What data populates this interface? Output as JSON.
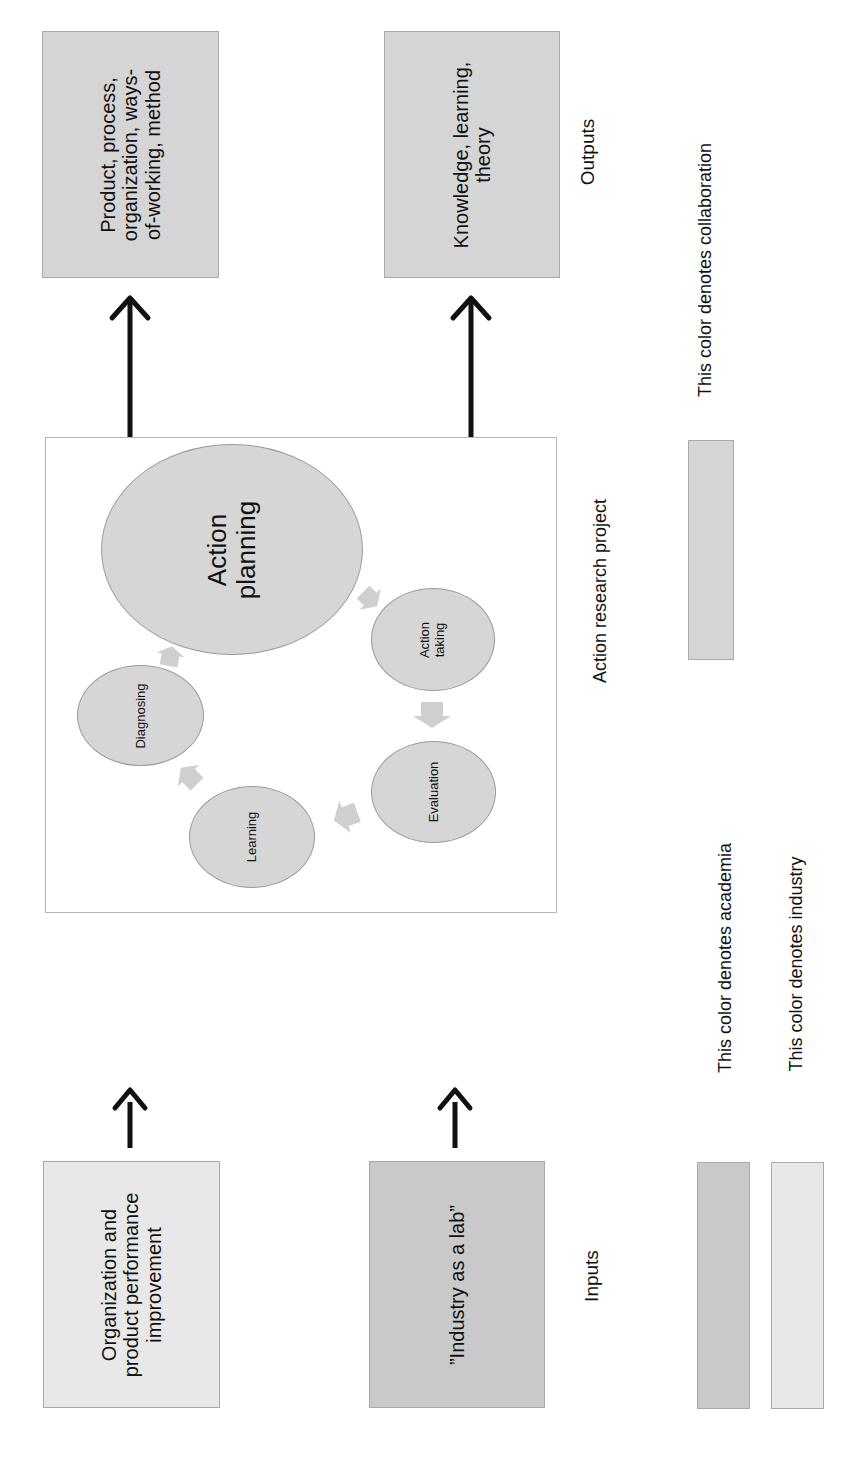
{
  "outputs": {
    "label": "Outputs",
    "boxes": [
      {
        "text_lines": [
          "Product, process,",
          "organization, ways-",
          "of-working, method"
        ],
        "type": "collaboration"
      },
      {
        "text_lines": [
          "Knowledge, learning,",
          "theory"
        ],
        "type": "collaboration"
      }
    ]
  },
  "inputs": {
    "label": "Inputs",
    "boxes": [
      {
        "text_lines": [
          "Organization and",
          "product performance",
          "improvement"
        ],
        "type": "industry"
      },
      {
        "text_lines": [
          "”Industry as a lab”"
        ],
        "type": "academia"
      }
    ]
  },
  "project": {
    "label": "Action research project",
    "cycle": [
      {
        "name": "Diagnosing"
      },
      {
        "name": "Action planning",
        "lines": [
          "Action",
          "planning"
        ]
      },
      {
        "name": "Action taking",
        "lines": [
          "Action",
          "taking"
        ]
      },
      {
        "name": "Evaluation"
      },
      {
        "name": "Learning"
      }
    ]
  },
  "legend": {
    "items": [
      {
        "text": "This color denotes academia",
        "color": "#c9c9c9"
      },
      {
        "text": "This color denotes industry",
        "color": "#e8e8e8"
      },
      {
        "text": "This color denotes collaboration",
        "color": "#d5d5d5"
      }
    ]
  },
  "colors": {
    "academia": "#c9c9c9",
    "industry": "#e8e8e8",
    "collaboration": "#d5d5d5",
    "arrow": "#111111",
    "cycle_arrow": "#cfcfcf"
  }
}
